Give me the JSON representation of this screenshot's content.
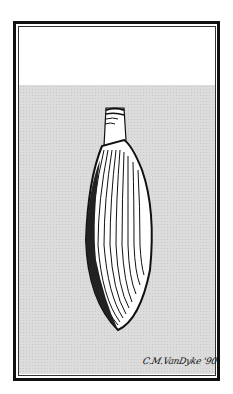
{
  "illustration": {
    "subject": "clam-shell-with-siphon",
    "style": "pen-and-ink",
    "background_colors": {
      "upper": "#ffffff",
      "lower": "#dcdcdc"
    },
    "border_color": "#111111"
  },
  "signature": {
    "text": "C.M.VanDyke '90"
  }
}
